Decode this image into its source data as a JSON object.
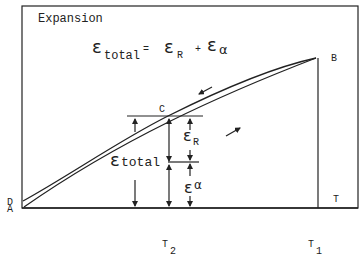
{
  "diagram": {
    "title": "Expansion",
    "equation": {
      "lhs_symbol": "ε",
      "lhs_sub": "total",
      "equals": "=",
      "rhs1_symbol": "ε",
      "rhs1_sub": "R",
      "plus": "+",
      "rhs2_symbol": "ε",
      "rhs2_sub": "α"
    },
    "points": {
      "A": "A",
      "B": "B",
      "C": "C",
      "D": "D"
    },
    "axis": {
      "x_label": "T",
      "tick_T1": "T",
      "tick_T1_sub": "1",
      "tick_T2": "T",
      "tick_T2_sub": "2"
    },
    "annotations": {
      "eps_total_symbol": "ε",
      "eps_total_sub": "total",
      "eps_R_symbol": "ε",
      "eps_R_sub": "R",
      "eps_alpha_symbol": "ε",
      "eps_alpha_sub": "α"
    },
    "curves": [
      {
        "name": "heating",
        "from": "A",
        "to": "B",
        "direction": "up"
      },
      {
        "name": "cooling",
        "from": "B",
        "to": "D",
        "direction": "down"
      }
    ]
  }
}
